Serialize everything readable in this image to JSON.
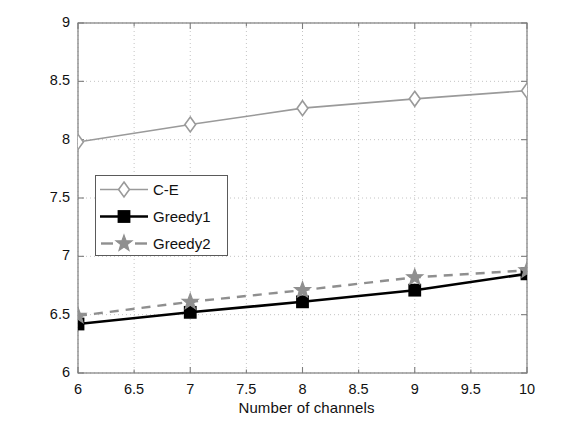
{
  "chart_data": {
    "type": "line",
    "title": "",
    "xlabel": "Number of channels",
    "ylabel": "Utility of the secondary network",
    "xlim": [
      6,
      10
    ],
    "ylim": [
      6,
      9
    ],
    "xticks": [
      "6",
      "6.5",
      "7",
      "7.5",
      "8",
      "8.5",
      "9",
      "9.5",
      "10"
    ],
    "xtick_values": [
      6,
      6.5,
      7,
      7.5,
      8,
      8.5,
      9,
      9.5,
      10
    ],
    "yticks": [
      "6",
      "6.5",
      "7",
      "7.5",
      "8",
      "8.5",
      "9"
    ],
    "ytick_values": [
      6,
      6.5,
      7,
      7.5,
      8,
      8.5,
      9
    ],
    "grid": true,
    "grid_style": "dotted",
    "legend_position": "center-left",
    "x": [
      6,
      7,
      8,
      9,
      10
    ],
    "series": [
      {
        "name": "C-E",
        "values": [
          7.98,
          8.13,
          8.27,
          8.35,
          8.42
        ],
        "color": "#9a9a9a",
        "marker": "diamond",
        "linestyle": "solid",
        "linewidth": 1.6
      },
      {
        "name": "Greedy1",
        "values": [
          6.42,
          6.52,
          6.61,
          6.71,
          6.85
        ],
        "color": "#000000",
        "marker": "square",
        "linestyle": "solid",
        "linewidth": 2.6
      },
      {
        "name": "Greedy2",
        "values": [
          6.49,
          6.61,
          6.71,
          6.82,
          6.88
        ],
        "color": "#8f8f8f",
        "marker": "star",
        "linestyle": "dashed",
        "linewidth": 2.4
      }
    ]
  },
  "legend": {
    "entries": [
      {
        "label": "C-E"
      },
      {
        "label": "Greedy1"
      },
      {
        "label": "Greedy2"
      }
    ]
  },
  "axes": {
    "x_title": "Number of channels",
    "y_title": "Utility of the secondary network",
    "x_tick_labels": [
      "6",
      "6.5",
      "7",
      "7.5",
      "8",
      "8.5",
      "9",
      "9.5",
      "10"
    ],
    "y_tick_labels": [
      "6",
      "6.5",
      "7",
      "7.5",
      "8",
      "8.5",
      "9"
    ]
  },
  "colors": {
    "axis": "#7d7d7d",
    "grid": "#bdbdbd",
    "text": "#111111",
    "ce": "#9a9a9a",
    "greedy1": "#000000",
    "greedy2": "#8f8f8f"
  }
}
